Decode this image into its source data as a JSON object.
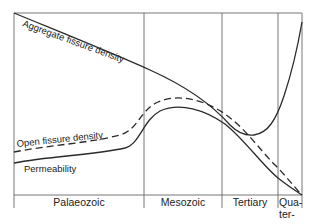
{
  "diagram": {
    "curves": [
      {
        "name": "Aggregate fissure density",
        "style": "solid"
      },
      {
        "name": "Open fissure density",
        "style": "dashed"
      },
      {
        "name": "Permeability",
        "style": "solid"
      }
    ],
    "periods": [
      {
        "label": "Palaeozoic"
      },
      {
        "label": "Mesozoic"
      },
      {
        "label": "Tertiary"
      },
      {
        "label_lines": [
          "Qua-",
          "ter-",
          "nary"
        ]
      }
    ],
    "colors": {
      "line": "#2a2a2a",
      "frame": "#777777",
      "text": "#222222"
    }
  }
}
